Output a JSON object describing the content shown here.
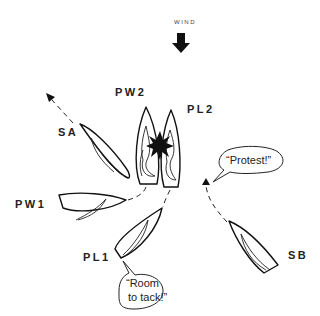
{
  "wind": {
    "label": "WIND",
    "icon": "arrow-down-icon"
  },
  "boats": [
    {
      "id": "SA",
      "label": "SA"
    },
    {
      "id": "PW2",
      "label": "PW2"
    },
    {
      "id": "PL2",
      "label": "PL2"
    },
    {
      "id": "PW1",
      "label": "PW1"
    },
    {
      "id": "PL1",
      "label": "PL1"
    },
    {
      "id": "SB",
      "label": "SB"
    }
  ],
  "speech": {
    "protest": "“Protest!”",
    "room_line1": "“Room",
    "room_line2": "to tack!”"
  },
  "colors": {
    "line": "#111111",
    "background": "#ffffff"
  }
}
